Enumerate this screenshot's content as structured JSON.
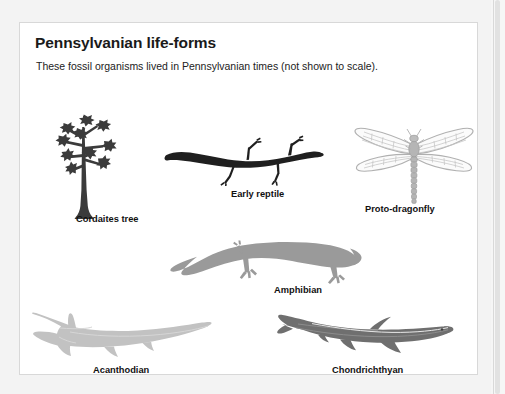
{
  "figure": {
    "title": "Pennsylvanian life-forms",
    "subtitle": "These fossil organisms lived in Pennsylvanian times (not shown to scale).",
    "card_background": "#ffffff",
    "card_border_color": "#d8d8d8",
    "page_background": "#f3f3f3"
  },
  "organisms": [
    {
      "id": "cordaites-tree",
      "label": "Cordaites tree",
      "icon": "cordaites-tree-silhouette",
      "fill": "#3b3b3b"
    },
    {
      "id": "early-reptile",
      "label": "Early reptile",
      "icon": "early-reptile-silhouette",
      "fill": "#1f1f1f"
    },
    {
      "id": "proto-dragonfly",
      "label": "Proto-dragonfly",
      "icon": "proto-dragonfly-silhouette",
      "fill": "#b9b9b9"
    },
    {
      "id": "amphibian",
      "label": "Amphibian",
      "icon": "amphibian-silhouette",
      "fill": "#9a9a9a"
    },
    {
      "id": "acanthodian",
      "label": "Acanthodian",
      "icon": "acanthodian-fish-silhouette",
      "fill": "#c0c0c0"
    },
    {
      "id": "chondrichthyan",
      "label": "Chondrichthyan",
      "icon": "chondrichthyan-shark-silhouette",
      "fill": "#6f6f6f"
    }
  ],
  "scrollbar": {
    "track_color": "#f6f6f6",
    "thumb_color": "#e2e2e2"
  }
}
